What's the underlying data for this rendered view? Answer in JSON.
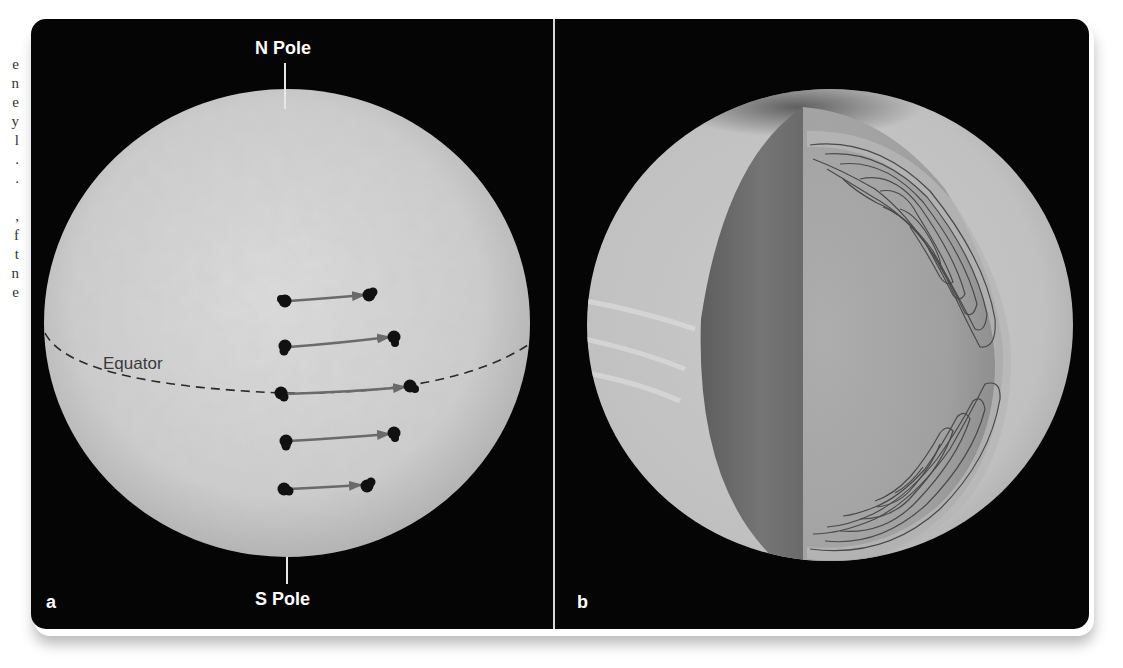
{
  "margin_text": {
    "fragments": [
      "e",
      "n",
      "e",
      "y",
      "l",
      ".",
      ".",
      "",
      ",",
      "f",
      "t",
      "n",
      "e"
    ]
  },
  "panel_a": {
    "letter": "a",
    "north_label": "N Pole",
    "south_label": "S Pole",
    "equator_label": "Equator",
    "sunspot_tracks": [
      {
        "row": 1,
        "start_x": 255,
        "end_x": 335,
        "y": 281
      },
      {
        "row": 2,
        "start_x": 255,
        "end_x": 362,
        "y": 323
      },
      {
        "row": 3,
        "start_x": 252,
        "end_x": 378,
        "y": 368
      },
      {
        "row": 4,
        "start_x": 255,
        "end_x": 362,
        "y": 415
      },
      {
        "row": 5,
        "start_x": 255,
        "end_x": 335,
        "y": 470
      }
    ],
    "colors": {
      "surface": "#cfcfcf",
      "arrow": "#6a6a6a",
      "spot": "#111111",
      "equator": "#2a2a2a"
    }
  },
  "panel_b": {
    "letter": "b",
    "description": "Cutaway sphere showing internal circulation cells",
    "colors": {
      "surface": "#c4c4c4",
      "cut_face_dark": "#6e6e6e",
      "cut_face_light": "#a8a8a8",
      "flow_lines": "#4a4a4a"
    }
  },
  "frame": {
    "background": "#050505",
    "divider_color": "#d9d9d9"
  }
}
